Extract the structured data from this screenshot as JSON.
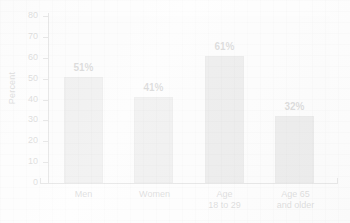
{
  "chart_data": {
    "type": "bar",
    "title": "",
    "subtitle": "",
    "xlabel": "",
    "ylabel": "Percent",
    "ylim": [
      0,
      80
    ],
    "ytick_step": 10,
    "yticks": [
      80,
      70,
      60,
      50,
      40,
      30,
      20,
      10,
      0
    ],
    "grid": false,
    "legend": "none",
    "categories": [
      "Men",
      "Women",
      "Age 18 to 29",
      "Age 65 and older"
    ],
    "category_lines": [
      {
        "line1": "Men",
        "line2": ""
      },
      {
        "line1": "Women",
        "line2": ""
      },
      {
        "line1": "Age",
        "line2": "18 to 29"
      },
      {
        "line1": "Age 65",
        "line2": "and older"
      }
    ],
    "values": [
      51,
      41,
      61,
      32
    ],
    "value_labels": [
      "51%",
      "41%",
      "61%",
      "32%"
    ],
    "bar_colors": [
      "#a8a8a8",
      "#a8a8a8",
      "#949494",
      "#949494"
    ],
    "plot_background": "#f7f7f7",
    "axis_color": "#6e6e6e",
    "text_color": "#2b2b2b"
  }
}
